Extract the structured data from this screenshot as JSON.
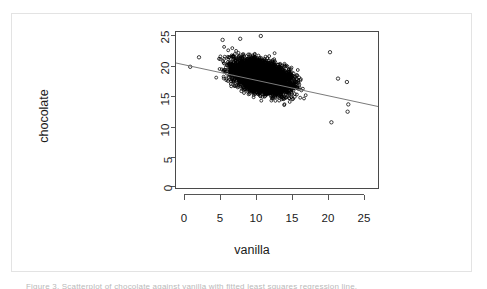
{
  "figure": {
    "background_color": "#ffffff",
    "frame_border_color": "#e3e3e3",
    "caption_text": "Figure 3. Scatterplot of chocolate against vanilla with fitted least squares regression line."
  },
  "chart_data": {
    "type": "scatter",
    "title": "",
    "xlabel": "vanilla",
    "ylabel": "chocolate",
    "xlim": [
      -1.2,
      26.4
    ],
    "ylim": [
      -1.4,
      26.6
    ],
    "xticks": [
      0,
      5,
      10,
      15,
      20,
      25
    ],
    "yticks": [
      0,
      5,
      10,
      15,
      20,
      25
    ],
    "xtick_labels": [
      "0",
      "5",
      "10",
      "15",
      "20",
      "25"
    ],
    "ytick_labels": [
      "0",
      "5",
      "10",
      "15",
      "20",
      "25"
    ],
    "grid": false,
    "legend": null,
    "point_marker": "open-circle",
    "point_color": "#000000",
    "point_fill": "none",
    "n_points_approx": 4000,
    "relationship": "negative",
    "fit_line": {
      "type": "linear-regression",
      "color": "#6f6f6f",
      "x_start": -1.2,
      "y_start": 21.0,
      "x_end": 26.4,
      "y_end": 13.2,
      "slope": -0.283,
      "intercept": 20.66
    },
    "cloud": {
      "x_range": [
        0.6,
        22.4
      ],
      "y_range": [
        10.2,
        25.8
      ],
      "x_core": [
        3.0,
        18.5
      ],
      "y_core": [
        12.0,
        24.0
      ],
      "description": "Dense wedge-shaped cloud of open circles, widest near vanilla 8-13, tapering and sloping downward to the right."
    },
    "outliers": [
      {
        "x": 0.8,
        "y": 20.3
      },
      {
        "x": 2.0,
        "y": 22.0
      },
      {
        "x": 5.2,
        "y": 25.1
      },
      {
        "x": 7.6,
        "y": 25.3
      },
      {
        "x": 10.4,
        "y": 25.8
      },
      {
        "x": 19.8,
        "y": 22.9
      },
      {
        "x": 20.9,
        "y": 18.2
      },
      {
        "x": 22.1,
        "y": 17.6
      },
      {
        "x": 22.3,
        "y": 13.6
      },
      {
        "x": 22.2,
        "y": 12.3
      },
      {
        "x": 20.0,
        "y": 10.4
      }
    ]
  }
}
